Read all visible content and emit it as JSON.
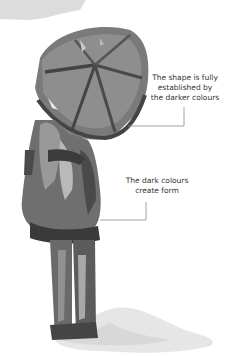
{
  "illustration": {
    "subject": "watercolour figure holding umbrella",
    "palette": {
      "dark": "#3f3f3f",
      "mid": "#6b6b6b",
      "light": "#9a9a9a",
      "wash": "#d6d6d6",
      "sky_wash": "#dcdcdc",
      "leader_line": "#8a8a8a"
    }
  },
  "annotations": [
    {
      "lines": [
        "The shape is fully",
        "established by",
        "the darker colours"
      ]
    },
    {
      "lines": [
        "The dark colours",
        "create form"
      ]
    }
  ]
}
